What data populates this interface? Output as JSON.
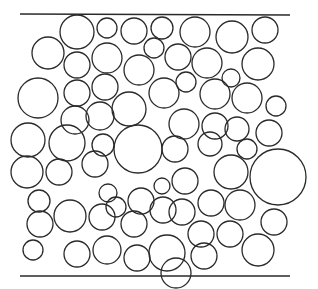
{
  "diagram": {
    "title": "",
    "colors": {
      "background": "#ffffff",
      "stroke": "#2a2a2a"
    },
    "stroke_width": 1.3,
    "boundaries": [
      {
        "name": "top-boundary-line",
        "x1": 20,
        "y1": 14,
        "x2": 290,
        "y2": 15
      },
      {
        "name": "bottom-boundary-line",
        "x1": 20,
        "y1": 276,
        "x2": 290,
        "y2": 276
      }
    ],
    "circles": [
      {
        "cx": 77,
        "cy": 32,
        "r": 17
      },
      {
        "cx": 107,
        "cy": 28,
        "r": 10
      },
      {
        "cx": 134,
        "cy": 31,
        "r": 13
      },
      {
        "cx": 162,
        "cy": 28,
        "r": 11
      },
      {
        "cx": 195,
        "cy": 32,
        "r": 15
      },
      {
        "cx": 232,
        "cy": 37,
        "r": 16
      },
      {
        "cx": 265,
        "cy": 30,
        "r": 13
      },
      {
        "cx": 48,
        "cy": 53,
        "r": 16
      },
      {
        "cx": 77,
        "cy": 65,
        "r": 13
      },
      {
        "cx": 107,
        "cy": 58,
        "r": 15
      },
      {
        "cx": 154,
        "cy": 48,
        "r": 10
      },
      {
        "cx": 178,
        "cy": 57,
        "r": 13
      },
      {
        "cx": 207,
        "cy": 63,
        "r": 15
      },
      {
        "cx": 258,
        "cy": 64,
        "r": 16
      },
      {
        "cx": 139,
        "cy": 70,
        "r": 15
      },
      {
        "cx": 186,
        "cy": 82,
        "r": 10
      },
      {
        "cx": 231,
        "cy": 78,
        "r": 9
      },
      {
        "cx": 38,
        "cy": 98,
        "r": 20
      },
      {
        "cx": 77,
        "cy": 93,
        "r": 13
      },
      {
        "cx": 105,
        "cy": 87,
        "r": 13
      },
      {
        "cx": 129,
        "cy": 109,
        "r": 17
      },
      {
        "cx": 164,
        "cy": 93,
        "r": 15
      },
      {
        "cx": 215,
        "cy": 94,
        "r": 15
      },
      {
        "cx": 247,
        "cy": 98,
        "r": 15
      },
      {
        "cx": 276,
        "cy": 106,
        "r": 10
      },
      {
        "cx": 75,
        "cy": 120,
        "r": 14
      },
      {
        "cx": 100,
        "cy": 116,
        "r": 14
      },
      {
        "cx": 184,
        "cy": 124,
        "r": 15
      },
      {
        "cx": 215,
        "cy": 126,
        "r": 13
      },
      {
        "cx": 237,
        "cy": 129,
        "r": 12
      },
      {
        "cx": 269,
        "cy": 133,
        "r": 13
      },
      {
        "cx": 28,
        "cy": 140,
        "r": 17
      },
      {
        "cx": 67,
        "cy": 143,
        "r": 18
      },
      {
        "cx": 103,
        "cy": 145,
        "r": 11
      },
      {
        "cx": 138,
        "cy": 149,
        "r": 24
      },
      {
        "cx": 175,
        "cy": 149,
        "r": 13
      },
      {
        "cx": 210,
        "cy": 144,
        "r": 12
      },
      {
        "cx": 247,
        "cy": 149,
        "r": 10
      },
      {
        "cx": 27,
        "cy": 172,
        "r": 16
      },
      {
        "cx": 59,
        "cy": 172,
        "r": 13
      },
      {
        "cx": 95,
        "cy": 164,
        "r": 13
      },
      {
        "cx": 185,
        "cy": 181,
        "r": 13
      },
      {
        "cx": 231,
        "cy": 172,
        "r": 17
      },
      {
        "cx": 278,
        "cy": 177,
        "r": 28
      },
      {
        "cx": 39,
        "cy": 201,
        "r": 11
      },
      {
        "cx": 108,
        "cy": 193,
        "r": 9
      },
      {
        "cx": 141,
        "cy": 201,
        "r": 13
      },
      {
        "cx": 162,
        "cy": 186,
        "r": 8
      },
      {
        "cx": 163,
        "cy": 210,
        "r": 13
      },
      {
        "cx": 211,
        "cy": 203,
        "r": 13
      },
      {
        "cx": 240,
        "cy": 205,
        "r": 15
      },
      {
        "cx": 40,
        "cy": 224,
        "r": 13
      },
      {
        "cx": 70,
        "cy": 216,
        "r": 16
      },
      {
        "cx": 102,
        "cy": 217,
        "r": 13
      },
      {
        "cx": 134,
        "cy": 224,
        "r": 13
      },
      {
        "cx": 182,
        "cy": 212,
        "r": 13
      },
      {
        "cx": 274,
        "cy": 222,
        "r": 13
      },
      {
        "cx": 33,
        "cy": 250,
        "r": 10
      },
      {
        "cx": 77,
        "cy": 254,
        "r": 13
      },
      {
        "cx": 107,
        "cy": 250,
        "r": 14
      },
      {
        "cx": 137,
        "cy": 258,
        "r": 13
      },
      {
        "cx": 167,
        "cy": 253,
        "r": 18
      },
      {
        "cx": 201,
        "cy": 234,
        "r": 13
      },
      {
        "cx": 204,
        "cy": 256,
        "r": 13
      },
      {
        "cx": 230,
        "cy": 234,
        "r": 13
      },
      {
        "cx": 258,
        "cy": 250,
        "r": 16
      },
      {
        "cx": 116,
        "cy": 207,
        "r": 10
      },
      {
        "cx": 176,
        "cy": 273,
        "r": 15
      }
    ]
  }
}
